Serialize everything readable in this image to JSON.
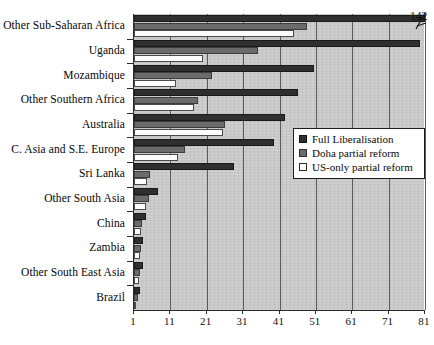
{
  "chart_data": {
    "type": "bar",
    "orientation": "horizontal",
    "title": "",
    "xlabel": "",
    "ylabel": "",
    "xlim": [
      1,
      81
    ],
    "xticks": [
      1,
      11,
      21,
      31,
      41,
      51,
      61,
      71,
      81
    ],
    "grid": true,
    "legend_position": "middle-right",
    "categories": [
      "Other Sub-Saharan Africa",
      "Uganda",
      "Mozambique",
      "Other Southern Africa",
      "Australia",
      "C. Asia and S.E. Europe",
      "Sri Lanka",
      "Other South Asia",
      "China",
      "Zambia",
      "Other South East Asia",
      "Brazil"
    ],
    "series": [
      {
        "name": "Full Liberalisation",
        "color": "#2f2f2f",
        "values": [
          142,
          79.5,
          50.5,
          46,
          42.5,
          39.5,
          28.5,
          7.5,
          4.2,
          3.6,
          3.4,
          2.6
        ]
      },
      {
        "name": "Doha partial reform",
        "color": "#6b6b6b",
        "values": [
          48.5,
          35,
          22.5,
          18.5,
          26,
          15,
          5.5,
          5.2,
          3.2,
          3.0,
          2.6,
          2.0
        ]
      },
      {
        "name": "US-only partial reform",
        "color": "#ffffff",
        "values": [
          45,
          20,
          12.5,
          17.5,
          25.5,
          13,
          4.5,
          4.4,
          3.0,
          2.7,
          2.3,
          1.6
        ]
      }
    ],
    "annotations": [
      {
        "text": "142",
        "note": "broken-axis value for Other Sub-Saharan Africa, Full Liberalisation"
      }
    ]
  },
  "legend": {
    "items": [
      {
        "label": "Full Liberalisation",
        "swatch": "dark-square-swatch"
      },
      {
        "label": "Doha partial reform",
        "swatch": "gray-square-swatch"
      },
      {
        "label": "US-only partial reform",
        "swatch": "white-square-swatch"
      }
    ]
  },
  "axis": {
    "x_tick_labels": [
      "1",
      "11",
      "21",
      "31",
      "41",
      "51",
      "61",
      "71",
      "81"
    ]
  },
  "colors": {
    "plot_background": "#c9c9c9",
    "series_full": "#2f2f2f",
    "series_doha": "#6b6b6b",
    "series_us": "#ffffff",
    "axis": "#2b2b2b",
    "gridline": "#5a5a5a"
  }
}
